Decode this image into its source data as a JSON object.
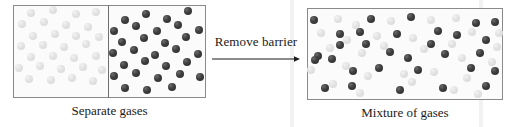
{
  "figure": {
    "transition_label": "Remove barrier",
    "arrow_icon": "right-arrow-icon",
    "captions": {
      "left": "Separate gases",
      "right": "Mixture of gases"
    }
  },
  "colors": {
    "dark_particle": "#3d3d3d",
    "light_particle": "#e2e2e2",
    "box_border": "#8a8a8a",
    "barrier": "#6f6f6f",
    "box_fill": "#fbfbfb",
    "text": "#1a1a1a",
    "background": "#ffffff"
  },
  "chart_data": {
    "type": "scatter",
    "panels": [
      {
        "name": "separate-gases",
        "caption": "Separate gases",
        "box": {
          "x": 13,
          "y": 5,
          "width": 96,
          "height": 93
        },
        "barrier": {
          "x": 108,
          "y": 5,
          "height": 93
        },
        "chambers": [
          {
            "name": "left-chamber-light-gas",
            "species": "light",
            "count": 29,
            "points": [
              [
                31,
                13
              ],
              [
                53,
                10
              ],
              [
                76,
                14
              ],
              [
                96,
                12
              ],
              [
                22,
                24
              ],
              [
                44,
                22
              ],
              [
                66,
                25
              ],
              [
                88,
                27
              ],
              [
                33,
                36
              ],
              [
                55,
                34
              ],
              [
                76,
                36
              ],
              [
                99,
                37
              ],
              [
                21,
                46
              ],
              [
                43,
                45
              ],
              [
                64,
                47
              ],
              [
                86,
                44
              ],
              [
                31,
                57
              ],
              [
                53,
                56
              ],
              [
                74,
                58
              ],
              [
                96,
                56
              ],
              [
                19,
                68
              ],
              [
                40,
                66
              ],
              [
                61,
                69
              ],
              [
                83,
                67
              ],
              [
                102,
                70
              ],
              [
                29,
                79
              ],
              [
                51,
                80
              ],
              [
                72,
                78
              ],
              [
                93,
                81
              ]
            ]
          },
          {
            "name": "right-chamber-dark-gas",
            "species": "dark",
            "count": 30,
            "points": [
              [
                125,
                20
              ],
              [
                146,
                14
              ],
              [
                167,
                19
              ],
              [
                188,
                11
              ],
              [
                114,
                31
              ],
              [
                136,
                26
              ],
              [
                157,
                31
              ],
              [
                178,
                25
              ],
              [
                199,
                30
              ],
              [
                122,
                42
              ],
              [
                144,
                38
              ],
              [
                165,
                43
              ],
              [
                186,
                37
              ],
              [
                113,
                53
              ],
              [
                134,
                50
              ],
              [
                155,
                55
              ],
              [
                176,
                49
              ],
              [
                198,
                54
              ],
              [
                124,
                65
              ],
              [
                145,
                61
              ],
              [
                166,
                66
              ],
              [
                187,
                62
              ],
              [
                114,
                76
              ],
              [
                136,
                73
              ],
              [
                158,
                78
              ],
              [
                180,
                74
              ],
              [
                200,
                77
              ],
              [
                125,
                88
              ],
              [
                147,
                90
              ],
              [
                172,
                87
              ]
            ]
          }
        ]
      },
      {
        "name": "mixture-of-gases",
        "caption": "Mixture of gases",
        "box": {
          "x": 307,
          "y": 8,
          "width": 196,
          "height": 92
        },
        "species_counts": {
          "dark": 31,
          "light": 30
        },
        "dark_points": [
          [
            314,
            20
          ],
          [
            371,
            19
          ],
          [
            411,
            17
          ],
          [
            476,
            23
          ],
          [
            495,
            22
          ],
          [
            340,
            34
          ],
          [
            360,
            32
          ],
          [
            397,
            34
          ],
          [
            438,
            31
          ],
          [
            457,
            35
          ],
          [
            486,
            40
          ],
          [
            318,
            56
          ],
          [
            332,
            59
          ],
          [
            390,
            52
          ],
          [
            408,
            58
          ],
          [
            445,
            54
          ],
          [
            353,
            71
          ],
          [
            379,
            68
          ],
          [
            418,
            70
          ],
          [
            471,
            68
          ],
          [
            495,
            71
          ],
          [
            315,
            60
          ],
          [
            340,
            45
          ],
          [
            366,
            44
          ],
          [
            431,
            44
          ],
          [
            480,
            53
          ],
          [
            325,
            88
          ],
          [
            352,
            86
          ],
          [
            400,
            90
          ],
          [
            443,
            88
          ],
          [
            486,
            86
          ]
        ],
        "light_points": [
          [
            338,
            19
          ],
          [
            356,
            25
          ],
          [
            391,
            21
          ],
          [
            431,
            20
          ],
          [
            456,
            18
          ],
          [
            499,
            33
          ],
          [
            321,
            33
          ],
          [
            347,
            40
          ],
          [
            377,
            36
          ],
          [
            413,
            38
          ],
          [
            452,
            44
          ],
          [
            472,
            32
          ],
          [
            330,
            48
          ],
          [
            362,
            53
          ],
          [
            384,
            46
          ],
          [
            424,
            49
          ],
          [
            462,
            58
          ],
          [
            497,
            47
          ],
          [
            311,
            70
          ],
          [
            346,
            66
          ],
          [
            368,
            76
          ],
          [
            404,
            74
          ],
          [
            434,
            72
          ],
          [
            467,
            78
          ],
          [
            492,
            62
          ],
          [
            333,
            84
          ],
          [
            360,
            93
          ],
          [
            412,
            82
          ],
          [
            454,
            90
          ],
          [
            478,
            94
          ]
        ]
      }
    ],
    "annotations": [
      {
        "name": "remove-barrier-arrow",
        "text": "Remove barrier",
        "from": [
          213,
          57
        ],
        "to": [
          298,
          57
        ],
        "direction": "right"
      }
    ],
    "xlabel": "",
    "ylabel": "",
    "grid": false,
    "legend": "none"
  }
}
